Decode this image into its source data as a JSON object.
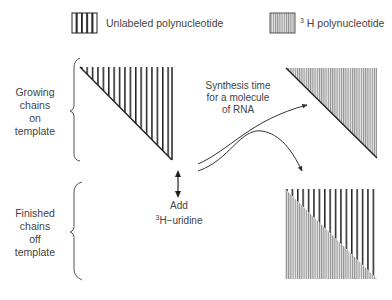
{
  "legend": {
    "unlabeled": {
      "label": "Unlabeled polynucleotide",
      "pattern": "black vertical stripes"
    },
    "labeled": {
      "label_sup": "3",
      "label_main": "H polynucleotide",
      "pattern": "gray fine vertical stripes"
    }
  },
  "left_labels": {
    "growing": {
      "lines": [
        "Growing",
        "chains",
        "on",
        "template"
      ]
    },
    "finished": {
      "lines": [
        "Finished",
        "chains",
        "off",
        "template"
      ]
    }
  },
  "center": {
    "add_label": "Add",
    "uridine_sup": "3",
    "uridine_main": "H−uridine",
    "synthesis_lines": [
      "Synthesis time",
      "for a molecule",
      "of RNA"
    ]
  },
  "colors": {
    "ink": "#222222",
    "labeled_fill": "#b5b5b5",
    "text": "#444444"
  }
}
